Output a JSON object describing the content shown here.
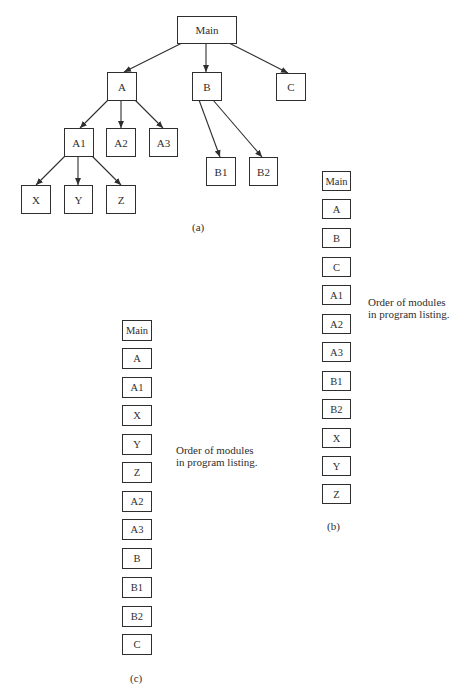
{
  "figure_a": {
    "caption": "(a)",
    "nodes": {
      "main": "Main",
      "a": "A",
      "b": "B",
      "c": "C",
      "a1": "A1",
      "a2": "A2",
      "a3": "A3",
      "b1": "B1",
      "b2": "B2",
      "x": "X",
      "y": "Y",
      "z": "Z"
    },
    "edges": [
      [
        "Main",
        "A"
      ],
      [
        "Main",
        "B"
      ],
      [
        "Main",
        "C"
      ],
      [
        "A",
        "A1"
      ],
      [
        "A",
        "A2"
      ],
      [
        "A",
        "A3"
      ],
      [
        "B",
        "B1"
      ],
      [
        "B",
        "B2"
      ],
      [
        "A1",
        "X"
      ],
      [
        "A1",
        "Y"
      ],
      [
        "A1",
        "Z"
      ]
    ]
  },
  "figure_b": {
    "caption": "(b)",
    "note_line1": "Order of modules",
    "note_line2": "in program listing.",
    "order": [
      "Main",
      "A",
      "B",
      "C",
      "A1",
      "A2",
      "A3",
      "B1",
      "B2",
      "X",
      "Y",
      "Z"
    ]
  },
  "figure_c": {
    "caption": "(c)",
    "note_line1": "Order of modules",
    "note_line2": "in program listing.",
    "order": [
      "Main",
      "A",
      "A1",
      "X",
      "Y",
      "Z",
      "A2",
      "A3",
      "B",
      "B1",
      "B2",
      "C"
    ]
  },
  "colors": {
    "ink": "#2e2e2e",
    "background": "#ffffff"
  }
}
